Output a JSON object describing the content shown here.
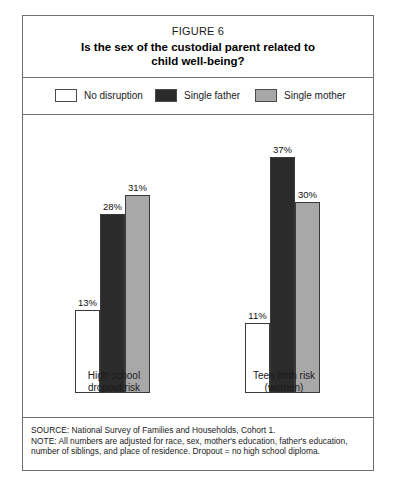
{
  "figure": {
    "number_label": "FIGURE 6",
    "title_line1": "Is the sex of the custodial parent related to",
    "title_line2": "child well-being?"
  },
  "legend": {
    "items": [
      {
        "label": "No disruption",
        "color": "#ffffff",
        "swatch_name": "legend-swatch-no-disruption"
      },
      {
        "label": "Single father",
        "color": "#2b2b2b",
        "swatch_name": "legend-swatch-single-father"
      },
      {
        "label": "Single mother",
        "color": "#a8a8a8",
        "swatch_name": "legend-swatch-single-mother"
      }
    ]
  },
  "groups": [
    {
      "label_line1": "High school",
      "label_line2": "dropout risk",
      "bars": [
        {
          "series": "No disruption",
          "value": 13,
          "value_label": "13%"
        },
        {
          "series": "Single father",
          "value": 28,
          "value_label": "28%"
        },
        {
          "series": "Single mother",
          "value": 31,
          "value_label": "31%"
        }
      ]
    },
    {
      "label_line1": "Teen birth risk",
      "label_line2": "(women)",
      "bars": [
        {
          "series": "No disruption",
          "value": 11,
          "value_label": "11%"
        },
        {
          "series": "Single father",
          "value": 37,
          "value_label": "37%"
        },
        {
          "series": "Single mother",
          "value": 30,
          "value_label": "30%"
        }
      ]
    }
  ],
  "footer": {
    "line1": "SOURCE: National Survey of Families and Households, Cohort 1.",
    "line2": "NOTE: All numbers are adjusted for race, sex, mother's education, father's education,",
    "line3": "number of siblings, and place of residence. Dropout = no high school diploma."
  },
  "chart_data": {
    "type": "bar",
    "title": "Is the sex of the custodial parent related to child well-being?",
    "subtitle": "FIGURE 6",
    "categories": [
      "High school dropout risk",
      "Teen birth risk (women)"
    ],
    "series": [
      {
        "name": "No disruption",
        "values": [
          13,
          11
        ],
        "color": "#ffffff"
      },
      {
        "name": "Single father",
        "values": [
          28,
          37
        ],
        "color": "#2b2b2b"
      },
      {
        "name": "Single mother",
        "values": [
          31,
          30
        ],
        "color": "#a8a8a8"
      }
    ],
    "xlabel": "",
    "ylabel": "",
    "ylim": [
      0,
      40
    ],
    "value_unit": "%",
    "grid": false,
    "legend_position": "top",
    "data_labels": true,
    "source": "National Survey of Families and Households, Cohort 1.",
    "note": "All numbers are adjusted for race, sex, mother's education, father's education, number of siblings, and place of residence. Dropout = no high school diploma."
  }
}
